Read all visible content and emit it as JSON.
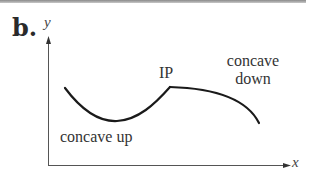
{
  "figure": {
    "part_label": "b.",
    "y_axis_label": "y",
    "x_axis_label": "x",
    "annotations": {
      "inflection_point": "IP",
      "concave_down_line1": "concave",
      "concave_down_line2": "down",
      "concave_up": "concave up"
    },
    "colors": {
      "curve": "#1a1a1a",
      "axes": "#555555",
      "text": "#333333",
      "top_rule": "#9a9a9a"
    }
  }
}
